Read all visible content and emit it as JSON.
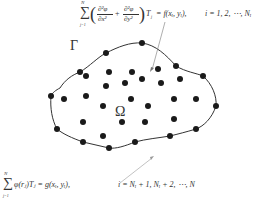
{
  "diagram": {
    "type": "meshless-collocation-domain",
    "interior_equation": {
      "sum_upper": "N",
      "sum_lower": "j=1",
      "numerator1": "∂²φ",
      "denominator1": "∂x²",
      "numerator2": "∂²φ",
      "denominator2": "∂y²",
      "after_paren": "T",
      "after_paren_sub": "j",
      "rhs": "= f(xᵢ, yᵢ),",
      "index_range": "i = 1, 2, ⋯, Nᵢ"
    },
    "boundary_equation": {
      "sum_upper": "N",
      "sum_lower": "j=1",
      "lhs": "φ(rⱼ)Tⱼ = g(xᵢ, yᵢ),",
      "index_range": "i = Nᵢ + 1, Nᵢ + 2, ⋯, N"
    },
    "labels": {
      "boundary": "Γ",
      "domain": "Ω"
    },
    "colors": {
      "dot": "#1a1a1a",
      "curve": "#333333",
      "arrow": "#777777"
    },
    "boundary_nodes": [
      [
        80,
        72
      ],
      [
        106,
        53
      ],
      [
        142,
        43
      ],
      [
        176,
        66
      ],
      [
        203,
        76
      ],
      [
        216,
        106
      ],
      [
        196,
        129
      ],
      [
        170,
        136
      ],
      [
        135,
        142
      ],
      [
        109,
        148
      ],
      [
        83,
        142
      ],
      [
        57,
        129
      ],
      [
        51,
        96
      ]
    ],
    "interior_nodes": [
      [
        109,
        72
      ],
      [
        132,
        72
      ],
      [
        158,
        69
      ],
      [
        86,
        76
      ],
      [
        106,
        86
      ],
      [
        125,
        83
      ],
      [
        142,
        79
      ],
      [
        161,
        83
      ],
      [
        180,
        79
      ],
      [
        64,
        99
      ],
      [
        86,
        96
      ],
      [
        131,
        99
      ],
      [
        174,
        99
      ],
      [
        196,
        99
      ],
      [
        103,
        106
      ],
      [
        148,
        106
      ],
      [
        83,
        122
      ],
      [
        122,
        122
      ],
      [
        145,
        122
      ],
      [
        174,
        119
      ],
      [
        103,
        136
      ]
    ]
  }
}
